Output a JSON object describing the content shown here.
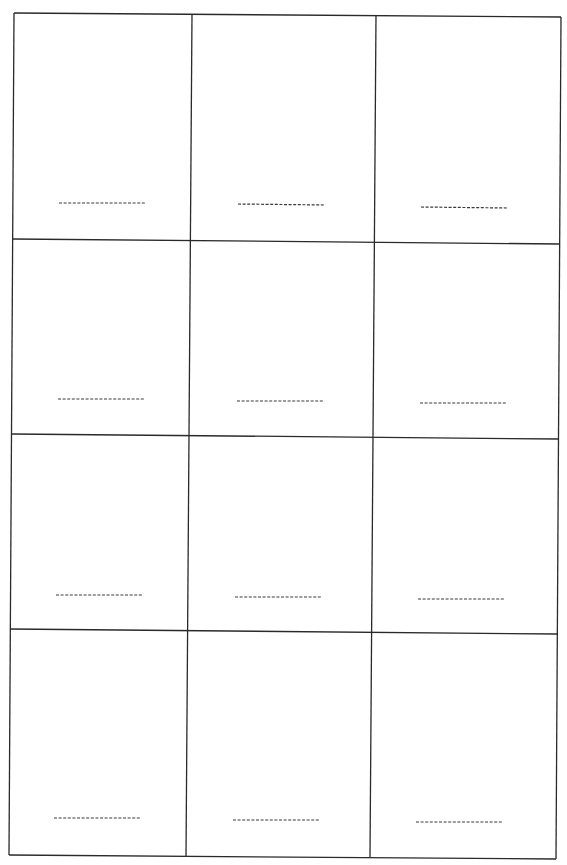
{
  "worksheet": {
    "type": "blank answer grid",
    "columns": 3,
    "rows": 4,
    "cells": [
      {
        "row": 1,
        "col": 1,
        "answer_line": "dashed",
        "text": ""
      },
      {
        "row": 1,
        "col": 2,
        "answer_line": "dashed",
        "text": ""
      },
      {
        "row": 1,
        "col": 3,
        "answer_line": "dashed",
        "text": ""
      },
      {
        "row": 2,
        "col": 1,
        "answer_line": "dashed",
        "text": ""
      },
      {
        "row": 2,
        "col": 2,
        "answer_line": "dashed",
        "text": ""
      },
      {
        "row": 2,
        "col": 3,
        "answer_line": "dashed",
        "text": ""
      },
      {
        "row": 3,
        "col": 1,
        "answer_line": "dashed",
        "text": ""
      },
      {
        "row": 3,
        "col": 2,
        "answer_line": "dashed",
        "text": ""
      },
      {
        "row": 3,
        "col": 3,
        "answer_line": "dashed",
        "text": ""
      },
      {
        "row": 4,
        "col": 1,
        "answer_line": "dashed",
        "text": ""
      },
      {
        "row": 4,
        "col": 2,
        "answer_line": "dashed",
        "text": ""
      },
      {
        "row": 4,
        "col": 3,
        "answer_line": "dashed",
        "text": ""
      }
    ],
    "colors": {
      "paper": "#ffffff",
      "lines": "#2a2a2a"
    }
  }
}
